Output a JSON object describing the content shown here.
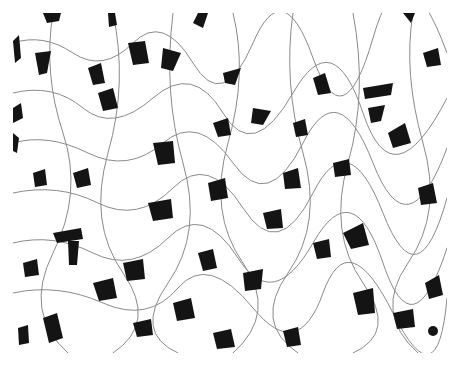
{
  "image": {
    "subject": "metallographic micrograph",
    "description": "Ferrite grains (white) with dark pearlite islands and thin grain boundaries",
    "colors": {
      "background": "#ffffff",
      "phase_dark": "#141414",
      "boundary": "#8a8a8a"
    }
  }
}
